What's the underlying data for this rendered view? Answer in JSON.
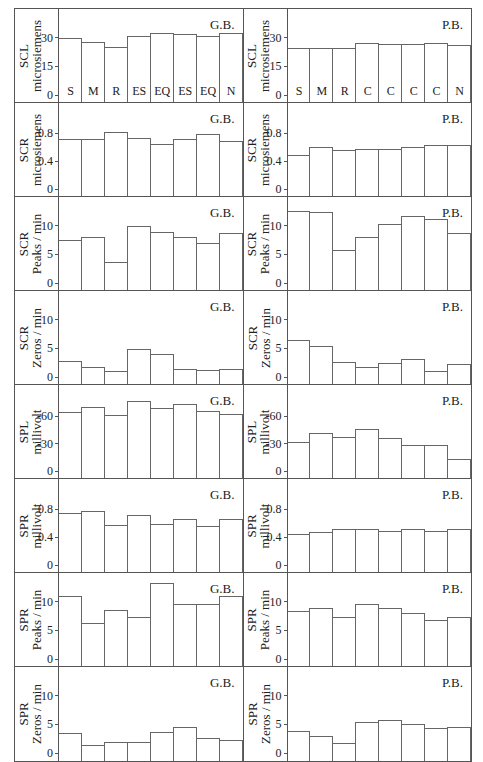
{
  "figure": {
    "columns": [
      "G.B.",
      "P.B."
    ],
    "categories_left": [
      "S",
      "M",
      "R",
      "ES",
      "EQ",
      "ES",
      "EQ",
      "N"
    ],
    "categories_right": [
      "S",
      "M",
      "R",
      "C",
      "C",
      "C",
      "C",
      "N"
    ]
  },
  "chart_data": [
    {
      "type": "bar",
      "group": "G.B.",
      "ylabel": "SCL microsiemens",
      "yticks": [
        "0",
        "15",
        "30"
      ],
      "ylim": [
        0,
        42
      ],
      "categories": [
        "S",
        "M",
        "R",
        "ES",
        "EQ",
        "ES",
        "EQ",
        "N"
      ],
      "values": [
        29.5,
        27.5,
        24.5,
        30.5,
        32,
        31.5,
        30.5,
        32
      ]
    },
    {
      "type": "bar",
      "group": "P.B.",
      "ylabel": "SCL microsiemens",
      "yticks": [
        "0",
        "15",
        "30"
      ],
      "ylim": [
        0,
        42
      ],
      "categories": [
        "S",
        "M",
        "R",
        "C",
        "C",
        "C",
        "C",
        "N"
      ],
      "values": [
        24,
        24,
        24,
        27,
        26.5,
        26.5,
        27,
        25.5
      ]
    },
    {
      "type": "bar",
      "group": "G.B.",
      "ylabel": "SCR microsiemens",
      "yticks": [
        "0",
        "0.4",
        "0.8"
      ],
      "ylim": [
        0,
        1.15
      ],
      "categories": [
        "S",
        "M",
        "R",
        "ES",
        "EQ",
        "ES",
        "EQ",
        "N"
      ],
      "values": [
        0.7,
        0.7,
        0.8,
        0.72,
        0.63,
        0.71,
        0.77,
        0.68
      ]
    },
    {
      "type": "bar",
      "group": "P.B.",
      "ylabel": "SCR microsiemens",
      "yticks": [
        "0",
        "0.4",
        "0.8"
      ],
      "ylim": [
        0,
        1.15
      ],
      "categories": [
        "S",
        "M",
        "R",
        "C",
        "C",
        "C",
        "C",
        "N"
      ],
      "values": [
        0.47,
        0.59,
        0.54,
        0.56,
        0.56,
        0.59,
        0.62,
        0.62
      ]
    },
    {
      "type": "bar",
      "group": "G.B.",
      "ylabel": "SCR Peaks / min",
      "yticks": [
        "0",
        "5",
        "10"
      ],
      "ylim": [
        0,
        14
      ],
      "categories": [
        "S",
        "M",
        "R",
        "ES",
        "EQ",
        "ES",
        "EQ",
        "N"
      ],
      "values": [
        7.3,
        7.8,
        3.5,
        9.8,
        8.8,
        7.8,
        6.9,
        8.6
      ]
    },
    {
      "type": "bar",
      "group": "P.B.",
      "ylabel": "SCR Peaks / min",
      "yticks": [
        "0",
        "5",
        "10"
      ],
      "ylim": [
        0,
        14
      ],
      "categories": [
        "S",
        "M",
        "R",
        "C",
        "C",
        "C",
        "C",
        "N"
      ],
      "values": [
        12.5,
        12.3,
        5.6,
        7.8,
        10.1,
        11.5,
        11.1,
        8.6
      ]
    },
    {
      "type": "bar",
      "group": "G.B.",
      "ylabel": "SCR Zeros / min",
      "yticks": [
        "0",
        "5",
        "10"
      ],
      "ylim": [
        0,
        14
      ],
      "categories": [
        "S",
        "M",
        "R",
        "ES",
        "EQ",
        "ES",
        "EQ",
        "N"
      ],
      "values": [
        2.7,
        1.6,
        0.8,
        4.8,
        3.8,
        1.3,
        1.0,
        1.3
      ]
    },
    {
      "type": "bar",
      "group": "P.B.",
      "ylabel": "SCR Zeros / min",
      "yticks": [
        "0",
        "5",
        "10"
      ],
      "ylim": [
        0,
        14
      ],
      "categories": [
        "S",
        "M",
        "R",
        "C",
        "C",
        "C",
        "C",
        "N"
      ],
      "values": [
        6.3,
        5.3,
        2.5,
        1.5,
        2.3,
        2.9,
        0.8,
        2.1
      ]
    },
    {
      "type": "bar",
      "group": "G.B.",
      "ylabel": "SPL millivolt",
      "yticks": [
        "0",
        "-30",
        "-60"
      ],
      "ylim": [
        0,
        -88
      ],
      "categories": [
        "S",
        "M",
        "R",
        "ES",
        "EQ",
        "ES",
        "EQ",
        "N"
      ],
      "values": [
        -64,
        -69,
        -61,
        -76,
        -68,
        -73,
        -65,
        -62
      ]
    },
    {
      "type": "bar",
      "group": "P.B.",
      "ylabel": "SPL millivolt",
      "yticks": [
        "0",
        "-30",
        "-60"
      ],
      "ylim": [
        0,
        -88
      ],
      "categories": [
        "S",
        "M",
        "R",
        "C",
        "C",
        "C",
        "C",
        "N"
      ],
      "values": [
        -31,
        -41,
        -36,
        -45,
        -35,
        -27,
        -27,
        -12
      ]
    },
    {
      "type": "bar",
      "group": "G.B.",
      "ylabel": "SPR millivolt",
      "yticks": [
        "0",
        "0.4",
        "0.8"
      ],
      "ylim": [
        0,
        1.15
      ],
      "categories": [
        "S",
        "M",
        "R",
        "ES",
        "EQ",
        "ES",
        "EQ",
        "N"
      ],
      "values": [
        0.74,
        0.76,
        0.56,
        0.7,
        0.58,
        0.64,
        0.54,
        0.65
      ]
    },
    {
      "type": "bar",
      "group": "P.B.",
      "ylabel": "SPR millivolt",
      "yticks": [
        "0",
        "0.4",
        "0.8"
      ],
      "ylim": [
        0,
        1.15
      ],
      "categories": [
        "S",
        "M",
        "R",
        "C",
        "C",
        "C",
        "C",
        "N"
      ],
      "values": [
        0.43,
        0.46,
        0.51,
        0.5,
        0.47,
        0.5,
        0.48,
        0.51
      ]
    },
    {
      "type": "bar",
      "group": "G.B.",
      "ylabel": "SPR Peaks / min",
      "yticks": [
        "0",
        "5",
        "10"
      ],
      "ylim": [
        0,
        14
      ],
      "categories": [
        "S",
        "M",
        "R",
        "ES",
        "EQ",
        "ES",
        "EQ",
        "N"
      ],
      "values": [
        10.9,
        6.1,
        8.4,
        7.2,
        13.2,
        9.4,
        9.4,
        10.9
      ]
    },
    {
      "type": "bar",
      "group": "P.B.",
      "ylabel": "SPR Peaks / min",
      "yticks": [
        "0",
        "5",
        "10"
      ],
      "ylim": [
        0,
        14
      ],
      "categories": [
        "S",
        "M",
        "R",
        "C",
        "C",
        "C",
        "C",
        "N"
      ],
      "values": [
        8.3,
        8.7,
        7.2,
        9.5,
        8.7,
        7.8,
        6.6,
        7.1
      ]
    },
    {
      "type": "bar",
      "group": "G.B.",
      "ylabel": "SPR Zeros / min",
      "yticks": [
        "0",
        "5",
        "10"
      ],
      "ylim": [
        0,
        14
      ],
      "categories": [
        "S",
        "M",
        "R",
        "ES",
        "EQ",
        "ES",
        "EQ",
        "N"
      ],
      "values": [
        3.5,
        1.4,
        2.0,
        2.0,
        3.6,
        4.5,
        2.6,
        2.3
      ]
    },
    {
      "type": "bar",
      "group": "P.B.",
      "ylabel": "SPR Zeros / min",
      "yticks": [
        "0",
        "5",
        "10"
      ],
      "ylim": [
        0,
        14
      ],
      "categories": [
        "S",
        "M",
        "R",
        "C",
        "C",
        "C",
        "C",
        "N"
      ],
      "values": [
        3.9,
        3.0,
        1.8,
        5.5,
        5.8,
        5.0,
        4.3,
        4.6
      ]
    }
  ]
}
